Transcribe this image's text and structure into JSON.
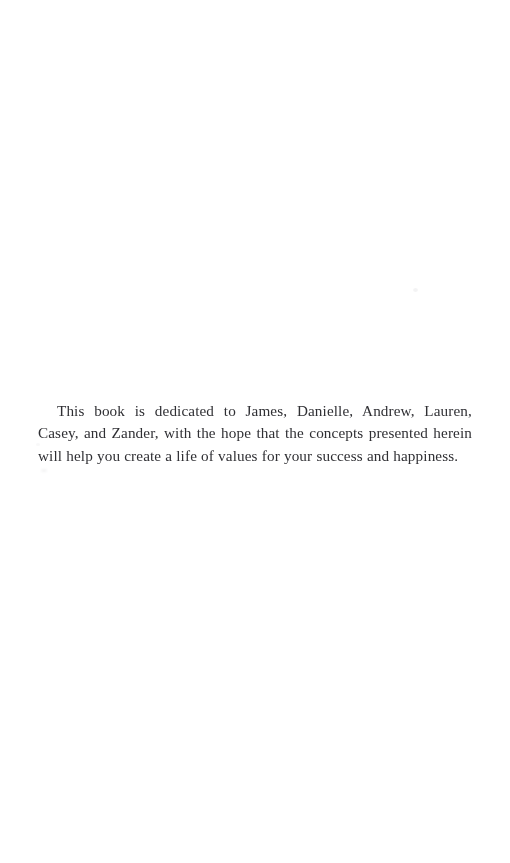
{
  "page": {
    "kind": "book-dedication-page",
    "background_color": "#ffffff",
    "text_color": "#2a2a2e",
    "width": 510,
    "height": 863
  },
  "dedication": {
    "text": "This book is dedicated to James, Danielle, Andrew, Lauren, Casey, and Zander, with the hope that the concepts presented herein will help you create a life of values for your success and happiness.",
    "lines": [
      "This book is dedicated to James, Danielle, Andrew, Lauren, Casey,",
      "and Zander, with the hope that the concepts presented herein will help",
      "you create a life of values for your success and happiness."
    ],
    "dedicatees": [
      "James",
      "Danielle",
      "Andrew",
      "Lauren",
      "Casey",
      "Zander"
    ],
    "alignment": "justified",
    "first_line_indent": "19px"
  }
}
